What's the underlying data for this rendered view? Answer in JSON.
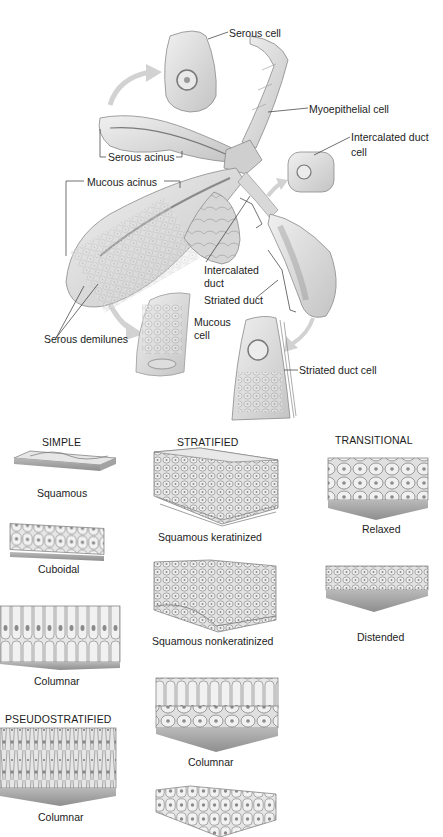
{
  "gland_diagram": {
    "labels": [
      {
        "id": "serous-cell",
        "text": "Serous cell",
        "x": 229,
        "y": 27
      },
      {
        "id": "myoepithelial-cell",
        "text": "Myoepithelial cell",
        "x": 309,
        "y": 103
      },
      {
        "id": "intercalated-duct-cell-1",
        "text": "Intercalated duct",
        "x": 351,
        "y": 131
      },
      {
        "id": "intercalated-duct-cell-2",
        "text": "cell",
        "x": 351,
        "y": 146
      },
      {
        "id": "serous-acinus",
        "text": "Serous acinus",
        "x": 108,
        "y": 151
      },
      {
        "id": "mucous-acinus",
        "text": "Mucous acinus",
        "x": 87,
        "y": 176
      },
      {
        "id": "intercalated-duct-1",
        "text": "Intercalated",
        "x": 204,
        "y": 264
      },
      {
        "id": "intercalated-duct-2",
        "text": "duct",
        "x": 204,
        "y": 277
      },
      {
        "id": "striated-duct",
        "text": "Striated duct",
        "x": 204,
        "y": 294
      },
      {
        "id": "mucous-cell-1",
        "text": "Mucous",
        "x": 194,
        "y": 316
      },
      {
        "id": "mucous-cell-2",
        "text": "cell",
        "x": 194,
        "y": 329
      },
      {
        "id": "serous-demilunes",
        "text": "Serous demilunes",
        "x": 44,
        "y": 333
      },
      {
        "id": "striated-duct-cell",
        "text": "Striated duct cell",
        "x": 299,
        "y": 364
      }
    ]
  },
  "epithelium_chart": {
    "columns": [
      {
        "id": "simple",
        "header": "SIMPLE",
        "header_x": 42,
        "header_y": 436
      },
      {
        "id": "stratified",
        "header": "STRATIFIED",
        "header_x": 177,
        "header_y": 436
      },
      {
        "id": "transitional",
        "header": "TRANSITIONAL",
        "header_x": 335,
        "header_y": 434
      },
      {
        "id": "pseudostratified",
        "header": "PSEUDOSTRATIFIED",
        "header_x": 5,
        "header_y": 713
      }
    ],
    "captions": [
      {
        "id": "simple-squamous",
        "text": "Squamous",
        "x": 37,
        "y": 487
      },
      {
        "id": "simple-cuboidal",
        "text": "Cuboidal",
        "x": 38,
        "y": 563
      },
      {
        "id": "simple-columnar",
        "text": "Columnar",
        "x": 34,
        "y": 675
      },
      {
        "id": "pseudo-columnar",
        "text": "Columnar",
        "x": 38,
        "y": 811
      },
      {
        "id": "strat-squamous-keratinized",
        "text": "Squamous keratinized",
        "x": 158,
        "y": 531
      },
      {
        "id": "strat-squamous-nonkeratinized",
        "text": "Squamous nonkeratinized",
        "x": 152,
        "y": 635
      },
      {
        "id": "strat-columnar",
        "text": "Columnar",
        "x": 188,
        "y": 756
      },
      {
        "id": "trans-relaxed",
        "text": "Relaxed",
        "x": 362,
        "y": 523
      },
      {
        "id": "trans-distended",
        "text": "Distended",
        "x": 357,
        "y": 631
      }
    ]
  },
  "colors": {
    "tissue_light": "#e4e4e4",
    "tissue_mid": "#c8c8c8",
    "tissue_dark": "#8a8a8a",
    "outline": "#6e6e6e",
    "leader_line": "#333333",
    "arrow": "#cfcfcf",
    "text": "#1c1c1c"
  }
}
